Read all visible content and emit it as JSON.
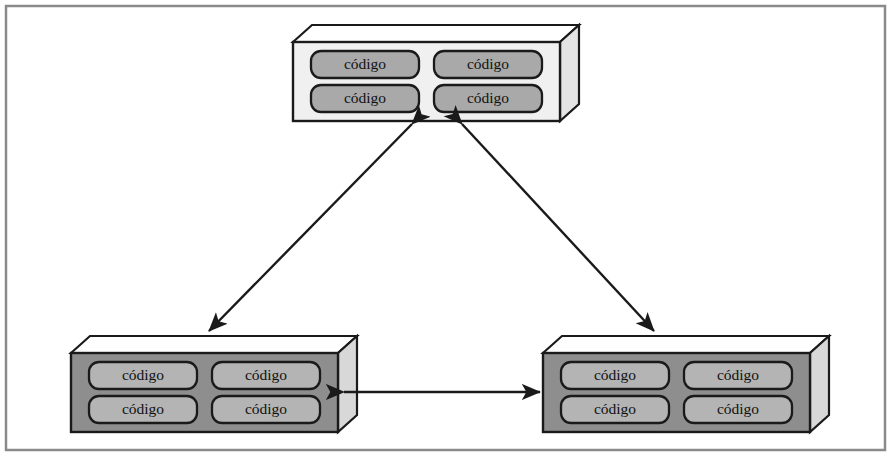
{
  "figure": {
    "frame": {
      "name": "outer-border",
      "x": 6,
      "y": 6,
      "width": 879,
      "height": 444,
      "stroke": "#8a8a8a",
      "stroke_width": 2.5,
      "fill": "#ffffff"
    },
    "pill_text": "código",
    "colors": {
      "light_box_face": "#f0f0f0",
      "light_box_top": "#ffffff",
      "light_box_side": "#e4e4e4",
      "light_box_pill": "#a9a9a9",
      "dark_box_face": "#8e8e8e",
      "dark_box_top": "#ffffff",
      "dark_box_side": "#d8d8d8",
      "dark_box_pill": "#b4b4b4",
      "outline": "#1a1a1a",
      "arrow": "#1a1a1a",
      "text": "#111111",
      "frame": "#8a8a8a"
    },
    "boxes": [
      {
        "id": "top-node",
        "name": "code-node-top",
        "variant": "light",
        "x": 293,
        "y": 42,
        "width": 267,
        "height": 79,
        "depth_x": 19,
        "depth_y": 17,
        "pills": [
          {
            "name": "pill-top-1",
            "label": "código"
          },
          {
            "name": "pill-top-2",
            "label": "código"
          },
          {
            "name": "pill-top-3",
            "label": "código"
          },
          {
            "name": "pill-top-4",
            "label": "código"
          }
        ]
      },
      {
        "id": "bottom-left-node",
        "name": "code-node-bottom-left",
        "variant": "dark",
        "x": 71,
        "y": 353,
        "width": 267,
        "height": 79,
        "depth_x": 19,
        "depth_y": 17,
        "pills": [
          {
            "name": "pill-bl-1",
            "label": "código"
          },
          {
            "name": "pill-bl-2",
            "label": "código"
          },
          {
            "name": "pill-bl-3",
            "label": "código"
          },
          {
            "name": "pill-bl-4",
            "label": "código"
          }
        ]
      },
      {
        "id": "bottom-right-node",
        "name": "code-node-bottom-right",
        "variant": "dark",
        "x": 543,
        "y": 353,
        "width": 267,
        "height": 79,
        "depth_x": 19,
        "depth_y": 17,
        "pills": [
          {
            "name": "pill-br-1",
            "label": "código"
          },
          {
            "name": "pill-br-2",
            "label": "código"
          },
          {
            "name": "pill-br-3",
            "label": "código"
          },
          {
            "name": "pill-br-4",
            "label": "código"
          }
        ]
      }
    ],
    "connectors": [
      {
        "id": "left-diagonal",
        "name": "connector-top-to-bottom-left",
        "kind": "double-arrow",
        "x1": 412,
        "y1": 124,
        "x2": 209,
        "y2": 331
      },
      {
        "id": "right-diagonal",
        "name": "connector-top-to-bottom-right",
        "kind": "double-arrow",
        "x1": 462,
        "y1": 124,
        "x2": 654,
        "y2": 331
      },
      {
        "id": "bottom-horizontal",
        "name": "connector-bottom-left-to-bottom-right",
        "kind": "double-arrow",
        "x1": 344,
        "y1": 392,
        "x2": 540,
        "y2": 392
      }
    ]
  }
}
